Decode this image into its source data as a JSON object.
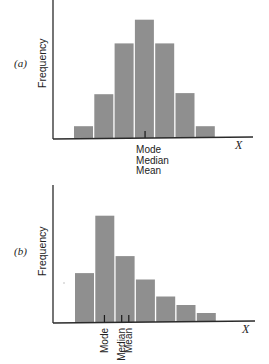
{
  "chart_data": [
    {
      "type": "bar",
      "panel_label": "(a)",
      "title": "",
      "xlabel": "X",
      "ylabel": "Frequency",
      "categories": [
        "1",
        "2",
        "3",
        "4",
        "5",
        "6",
        "7"
      ],
      "values": [
        1,
        3.7,
        8,
        10,
        8,
        3.8,
        1
      ],
      "ylim": [
        0,
        11.5
      ],
      "grid": false,
      "markers": [
        {
          "position": 3.5,
          "labels": [
            "Mode",
            "Median",
            "Mean"
          ],
          "orientation": "horizontal-stacked"
        }
      ]
    },
    {
      "type": "bar",
      "panel_label": "(b)",
      "title": "",
      "xlabel": "X",
      "ylabel": "Frequency",
      "categories": [
        "1",
        "2",
        "3",
        "4",
        "5",
        "6",
        "7"
      ],
      "values": [
        4.6,
        10,
        6.2,
        4,
        2.4,
        1.6,
        0.85
      ],
      "ylim": [
        0,
        12.7
      ],
      "grid": false,
      "markers": [
        {
          "position": 1.45,
          "labels": [
            "Mode"
          ],
          "orientation": "vertical"
        },
        {
          "position": 2.3,
          "labels": [
            "Median"
          ],
          "orientation": "vertical"
        },
        {
          "position": 2.65,
          "labels": [
            "Mean"
          ],
          "orientation": "vertical"
        }
      ]
    }
  ]
}
